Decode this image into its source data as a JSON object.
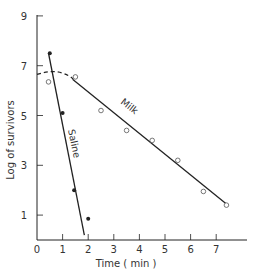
{
  "chart_data": {
    "type": "line",
    "title": "",
    "xlabel": "Time (min)",
    "ylabel": "Log of survivors",
    "xlim": [
      0,
      8
    ],
    "ylim": [
      0,
      9
    ],
    "x_ticks": [
      0,
      1,
      2,
      3,
      4,
      5,
      6,
      7
    ],
    "x_tick_labels": [
      "0",
      "1",
      "2",
      "3",
      "4",
      "5",
      "6",
      "7"
    ],
    "y_ticks": [
      1,
      3,
      5,
      7,
      9
    ],
    "y_tick_labels": [
      "1",
      "3",
      "5",
      "7",
      "9"
    ],
    "grid": false,
    "legend": "inline labels on lines",
    "series": [
      {
        "name": "Saline",
        "marker": "filled circle",
        "points": [
          {
            "x": 0.5,
            "y": 7.5
          },
          {
            "x": 1.0,
            "y": 5.1
          },
          {
            "x": 1.45,
            "y": 2.0
          },
          {
            "x": 2.0,
            "y": 0.85
          }
        ],
        "fit_line": {
          "x0": 0.45,
          "y0": 7.5,
          "x1": 1.85,
          "y1": 0.2
        }
      },
      {
        "name": "Milk",
        "marker": "open circle",
        "points": [
          {
            "x": 0.45,
            "y": 6.35
          },
          {
            "x": 1.5,
            "y": 6.55
          },
          {
            "x": 2.5,
            "y": 5.2
          },
          {
            "x": 3.5,
            "y": 4.4
          },
          {
            "x": 4.5,
            "y": 4.0
          },
          {
            "x": 5.5,
            "y": 3.2
          },
          {
            "x": 6.5,
            "y": 1.95
          },
          {
            "x": 7.4,
            "y": 1.4
          }
        ],
        "shoulder_dashed": {
          "from_x": 0,
          "to_x": 1.4,
          "y_start": 6.65,
          "y_peak": 6.75
        },
        "fit_line": {
          "x0": 1.4,
          "y0": 6.45,
          "x1": 7.4,
          "y1": 1.45
        }
      }
    ]
  },
  "labels": {
    "saline": "Saline",
    "milk": "Milk",
    "x_title": "Time ( min )",
    "y_title": "Log  of survivors"
  },
  "colors": {
    "ink": "#222222",
    "marker_open": "#555555"
  }
}
